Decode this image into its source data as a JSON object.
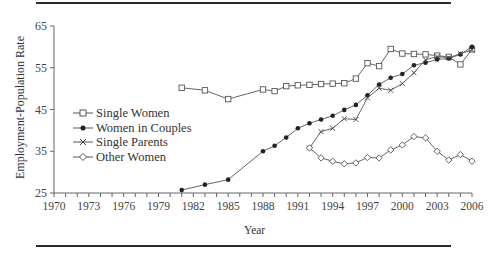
{
  "chart_data": {
    "type": "line",
    "title": "",
    "xlabel": "Year",
    "ylabel": "Employment-Population Rate",
    "xlim": [
      1970,
      2006
    ],
    "ylim": [
      25,
      65
    ],
    "x_ticks": [
      1970,
      1973,
      1976,
      1979,
      1982,
      1985,
      1988,
      1991,
      1994,
      1997,
      2000,
      2003,
      2006
    ],
    "y_ticks": [
      25,
      35,
      45,
      55,
      65
    ],
    "grid": false,
    "legend_position": "left-middle inside plot",
    "series": [
      {
        "name": "Single Women",
        "marker": "open-square",
        "x": [
          1981,
          1983,
          1985,
          1988,
          1989,
          1990,
          1991,
          1992,
          1993,
          1994,
          1995,
          1996,
          1997,
          1998,
          1999,
          2000,
          2001,
          2002,
          2003,
          2004,
          2005,
          2006
        ],
        "values": [
          50.2,
          49.6,
          47.5,
          49.8,
          49.4,
          50.6,
          50.8,
          50.9,
          51.1,
          51.2,
          51.3,
          52.4,
          56.1,
          55.4,
          59.5,
          58.4,
          58.3,
          58.2,
          57.9,
          57.6,
          55.8,
          59.4
        ]
      },
      {
        "name": "Women in Couples",
        "marker": "filled-circle",
        "x": [
          1981,
          1983,
          1985,
          1988,
          1989,
          1990,
          1991,
          1992,
          1993,
          1994,
          1995,
          1996,
          1997,
          1998,
          1999,
          2000,
          2001,
          2002,
          2003,
          2004,
          2005,
          2006
        ],
        "values": [
          25.7,
          27.0,
          28.2,
          35.0,
          36.3,
          38.3,
          40.5,
          41.7,
          42.6,
          43.5,
          44.9,
          46.1,
          48.4,
          51.0,
          52.6,
          53.5,
          55.6,
          56.2,
          57.0,
          57.2,
          58.2,
          60.0
        ]
      },
      {
        "name": "Single Parents",
        "marker": "x",
        "x": [
          1992,
          1993,
          1994,
          1995,
          1996,
          1997,
          1998,
          1999,
          2000,
          2001,
          2002,
          2003,
          2004,
          2005,
          2006
        ],
        "values": [
          35.8,
          39.7,
          40.5,
          42.8,
          42.6,
          47.8,
          50.1,
          49.6,
          51.2,
          53.8,
          56.9,
          57.7,
          57.4,
          58.4,
          59.2
        ]
      },
      {
        "name": "Other Women",
        "marker": "open-diamond",
        "x": [
          1992,
          1993,
          1994,
          1995,
          1996,
          1997,
          1998,
          1999,
          2000,
          2001,
          2002,
          2003,
          2004,
          2005,
          2006
        ],
        "values": [
          35.8,
          33.4,
          32.6,
          32.0,
          32.2,
          33.5,
          33.4,
          35.3,
          36.5,
          38.5,
          38.2,
          35.0,
          32.9,
          34.2,
          32.6
        ]
      }
    ]
  },
  "legend": {
    "items": [
      {
        "label": "Single Women"
      },
      {
        "label": "Women in Couples"
      },
      {
        "label": "Single Parents"
      },
      {
        "label": "Other Women"
      }
    ]
  },
  "axes": {
    "xlabel": "Year",
    "ylabel": "Employment-Population Rate"
  },
  "colors": {
    "line": "#555555",
    "axis": "#666666",
    "rule": "#2a2a2a"
  }
}
